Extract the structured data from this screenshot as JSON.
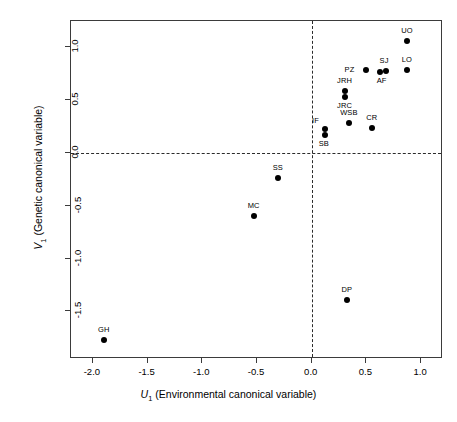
{
  "chart_data": {
    "type": "scatter",
    "title": "",
    "xlabel": "U1 (Environmental canonical variable)",
    "ylabel": "V1 (Genetic canonical variable)",
    "xlabel_var": "U",
    "xlabel_sub": "1",
    "xlabel_rest": " (Environmental canonical variable)",
    "ylabel_var": "V",
    "ylabel_sub": "1",
    "ylabel_rest": " (Genetic canonical variable)",
    "xlim": [
      -2.2,
      1.2
    ],
    "ylim": [
      -1.95,
      1.25
    ],
    "xticks": [
      -2.0,
      -1.5,
      -1.0,
      -0.5,
      0.0,
      0.5,
      1.0
    ],
    "xticklabels": [
      "-2.0",
      "-1.5",
      "-1.0",
      "-0.5",
      "0.0",
      "0.5",
      "1.0"
    ],
    "yticks": [
      -1.5,
      -1.0,
      -0.5,
      0.0,
      0.5,
      1.0
    ],
    "yticklabels": [
      "-1.5",
      "-1.0",
      "-0.5",
      "0.0",
      "0.5",
      "1.0"
    ],
    "grid": false,
    "legend": "none",
    "reference_lines": [
      {
        "axis": "horizontal",
        "value": 0.0,
        "style": "dashed"
      },
      {
        "axis": "vertical",
        "value": 0.0,
        "style": "dashed"
      }
    ],
    "marker": {
      "shape": "circle",
      "filled": true,
      "color": "#000000",
      "size_px": 6
    },
    "points": [
      {
        "label": "UO",
        "x": 0.87,
        "y": 1.06,
        "label_dx": 0,
        "label_dy": -10,
        "label_anchor": "center"
      },
      {
        "label": "LO",
        "x": 0.87,
        "y": 0.79,
        "label_dx": 0,
        "label_dy": -10,
        "label_anchor": "center"
      },
      {
        "label": "SJ",
        "x": 0.68,
        "y": 0.78,
        "label_dx": -2,
        "label_dy": -10,
        "label_anchor": "center"
      },
      {
        "label": "AF",
        "x": 0.62,
        "y": 0.77,
        "label_dx": 2,
        "label_dy": 9,
        "label_anchor": "center"
      },
      {
        "label": "PZ",
        "x": 0.5,
        "y": 0.79,
        "label_dx": -12,
        "label_dy": 0,
        "label_anchor": "right"
      },
      {
        "label": "JRH",
        "x": 0.3,
        "y": 0.59,
        "label_dx": 0,
        "label_dy": -10,
        "label_anchor": "center"
      },
      {
        "label": "JRC",
        "x": 0.3,
        "y": 0.53,
        "label_dx": 0,
        "label_dy": 9,
        "label_anchor": "center"
      },
      {
        "label": "WSB",
        "x": 0.34,
        "y": 0.28,
        "label_dx": 0,
        "label_dy": -10,
        "label_anchor": "center"
      },
      {
        "label": "CR",
        "x": 0.55,
        "y": 0.24,
        "label_dx": 0,
        "label_dy": -10,
        "label_anchor": "center"
      },
      {
        "label": "IF",
        "x": 0.12,
        "y": 0.23,
        "label_dx": -6,
        "label_dy": -8,
        "label_anchor": "right"
      },
      {
        "label": "SB",
        "x": 0.12,
        "y": 0.17,
        "label_dx": -1,
        "label_dy": 9,
        "label_anchor": "center"
      },
      {
        "label": "SS",
        "x": -0.31,
        "y": -0.24,
        "label_dx": 0,
        "label_dy": -10,
        "label_anchor": "center"
      },
      {
        "label": "MC",
        "x": -0.53,
        "y": -0.6,
        "label_dx": 0,
        "label_dy": -10,
        "label_anchor": "center"
      },
      {
        "label": "DP",
        "x": 0.32,
        "y": -1.39,
        "label_dx": 0,
        "label_dy": -10,
        "label_anchor": "center"
      },
      {
        "label": "GH",
        "x": -1.9,
        "y": -1.77,
        "label_dx": 0,
        "label_dy": -10,
        "label_anchor": "center"
      }
    ]
  }
}
